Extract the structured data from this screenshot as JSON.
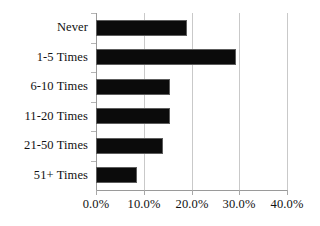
{
  "chart_data": {
    "type": "bar",
    "orientation": "horizontal",
    "title": "",
    "subtitle": "",
    "xlabel": "",
    "ylabel": "",
    "categories": [
      "Never",
      "1-5 Times",
      "6-10 Times",
      "11-20 Times",
      "21-50 Times",
      "51+ Times"
    ],
    "values": [
      19.1,
      29.4,
      15.4,
      15.4,
      14.0,
      8.6
    ],
    "value_format": "percent",
    "xlim": [
      0,
      40
    ],
    "ylim": null,
    "xticks": [
      0,
      10,
      20,
      30,
      40
    ],
    "xtick_labels": [
      "0.0%",
      "10.0%",
      "20.0%",
      "30.0%",
      "40.0%"
    ],
    "grid": "vertical",
    "legend": "none",
    "series": [
      {
        "name": "",
        "values": [
          19.1,
          29.4,
          15.4,
          15.4,
          14.0,
          8.6
        ],
        "color": "#0b0b0b"
      }
    ],
    "annotations": []
  },
  "style": {
    "bar_color": "#0b0b0b",
    "bar_border_color": "#5c5c5c",
    "grid_color": "#c9c9c9",
    "axis_color": "#9a9a9a",
    "background": "#ffffff",
    "text_color": "#111111"
  }
}
